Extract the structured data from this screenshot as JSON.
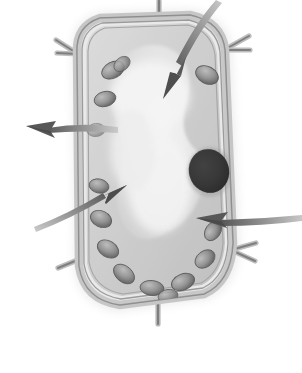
{
  "figure": {
    "label_letter": "b.",
    "caption_line_present": true,
    "palette": {
      "background": "#ffffff",
      "cell_wall_light": "#d9d9d9",
      "cell_wall_mid": "#9a9a9a",
      "cell_wall_dark": "#6f6f6f",
      "cytoplasm_light": "#f2f2f2",
      "cytoplasm_mid": "#cfcfcf",
      "vacuole_highlight": "#fbfbfb",
      "chloroplast_fill": "#9d9d9d",
      "chloroplast_shade": "#6a6a6a",
      "nucleus_fill": "#4a4a4a",
      "nucleus_dark": "#333333",
      "arrow_fill": "#585858",
      "arrow_tail_light": "#c8c8c8",
      "rule_line": "#4a4a4a",
      "text": "#262626"
    },
    "structures": [
      {
        "name": "cell-wall",
        "shape": "rounded-rectangle-outline"
      },
      {
        "name": "cell-membrane",
        "shape": "inner-outline"
      },
      {
        "name": "central-vacuole",
        "shape": "large-irregular-pale-region"
      },
      {
        "name": "cytoplasm",
        "shape": "region-between-membrane-and-vacuole"
      },
      {
        "name": "nucleus",
        "shape": "dark-oval"
      },
      {
        "name": "chloroplast",
        "shape": "small-oval",
        "count": 14
      },
      {
        "name": "wall-junction",
        "shape": "y-branch",
        "count": 7
      }
    ],
    "arrows": [
      {
        "name": "arrow-top-right-pointing-down-left",
        "points_to": "central-vacuole",
        "direction": "down-left"
      },
      {
        "name": "arrow-left-pointing-left",
        "points_to": "cell-wall",
        "direction": "left"
      },
      {
        "name": "arrow-lower-left-pointing-up-right",
        "points_to": "cytoplasm",
        "direction": "up-right"
      },
      {
        "name": "arrow-right-pointing-left",
        "points_to": "nucleus-region",
        "direction": "left"
      }
    ]
  }
}
